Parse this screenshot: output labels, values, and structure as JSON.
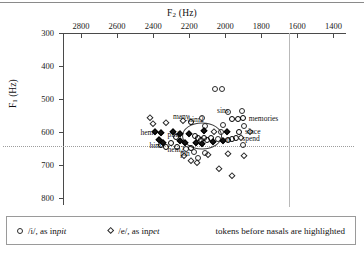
{
  "chart_data": {
    "type": "scatter",
    "title": "",
    "xlabel": "F2 (Hz)",
    "ylabel": "F1 (Hz)",
    "xlim": [
      2900,
      1330
    ],
    "ylim": [
      300,
      820
    ],
    "x_ticks": [
      2800,
      2600,
      2400,
      2200,
      2000,
      1800,
      1600,
      1400
    ],
    "y_ticks": [
      300,
      400,
      500,
      600,
      700,
      800
    ],
    "x_axis_reversed": true,
    "y_axis_reversed": true,
    "grid": false,
    "axis_position": "top-left",
    "reference_lines": [
      {
        "orientation": "horizontal",
        "value": 643,
        "style": "dotted"
      },
      {
        "orientation": "vertical",
        "value": 1648,
        "style": "solid-light"
      }
    ],
    "legend": {
      "position": "below-plot",
      "entries": [
        {
          "marker": "circle",
          "symbol": "/i/",
          "text": "/i/, as in ",
          "example": "pit"
        },
        {
          "marker": "diamond",
          "symbol": "/e/",
          "text": "/e/, as in ",
          "example": "pet"
        }
      ],
      "note": "tokens before nasals are highlighted"
    },
    "series": [
      {
        "name": "/i/, as in pit",
        "marker": "circle",
        "points": [
          {
            "x": 2055,
            "y": 468,
            "highlighted": false,
            "label": ""
          },
          {
            "x": 2020,
            "y": 470,
            "highlighted": false,
            "label": ""
          },
          {
            "x": 1985,
            "y": 538,
            "highlighted": false,
            "label": "sins"
          },
          {
            "x": 1905,
            "y": 536,
            "highlighted": false,
            "label": ""
          },
          {
            "x": 1960,
            "y": 560,
            "highlighted": true,
            "label": ""
          },
          {
            "x": 1930,
            "y": 560,
            "highlighted": true,
            "label": ""
          },
          {
            "x": 1900,
            "y": 558,
            "highlighted": true,
            "label": "memories"
          },
          {
            "x": 2010,
            "y": 578,
            "highlighted": false,
            "label": ""
          },
          {
            "x": 1895,
            "y": 582,
            "highlighted": false,
            "label": ""
          },
          {
            "x": 2025,
            "y": 598,
            "highlighted": false,
            "label": ""
          },
          {
            "x": 1925,
            "y": 598,
            "highlighted": true,
            "label": "since"
          },
          {
            "x": 2130,
            "y": 556,
            "highlighted": false,
            "label": ""
          },
          {
            "x": 2115,
            "y": 580,
            "highlighted": false,
            "label": ""
          },
          {
            "x": 2190,
            "y": 570,
            "highlighted": true,
            "label": "him2"
          },
          {
            "x": 2170,
            "y": 612,
            "highlighted": true,
            "label": ""
          },
          {
            "x": 2150,
            "y": 618,
            "highlighted": true,
            "label": ""
          },
          {
            "x": 2135,
            "y": 624,
            "highlighted": true,
            "label": ""
          },
          {
            "x": 2120,
            "y": 616,
            "highlighted": true,
            "label": ""
          },
          {
            "x": 2100,
            "y": 622,
            "highlighted": true,
            "label": ""
          },
          {
            "x": 2080,
            "y": 618,
            "highlighted": true,
            "label": ""
          },
          {
            "x": 2040,
            "y": 620,
            "highlighted": false,
            "label": "ten"
          },
          {
            "x": 1985,
            "y": 622,
            "highlighted": true,
            "label": ""
          },
          {
            "x": 1965,
            "y": 620,
            "highlighted": true,
            "label": ""
          },
          {
            "x": 1940,
            "y": 618,
            "highlighted": true,
            "label": "spend"
          },
          {
            "x": 2275,
            "y": 614,
            "highlighted": true,
            "label": "pin2"
          },
          {
            "x": 2300,
            "y": 632,
            "highlighted": true,
            "label": ""
          },
          {
            "x": 2330,
            "y": 644,
            "highlighted": true,
            "label": ""
          },
          {
            "x": 2355,
            "y": 638,
            "highlighted": true,
            "label": "him"
          },
          {
            "x": 2270,
            "y": 646,
            "highlighted": true,
            "label": "hem2"
          },
          {
            "x": 2215,
            "y": 652,
            "highlighted": false,
            "label": "pin"
          },
          {
            "x": 2190,
            "y": 648,
            "highlighted": true,
            "label": ""
          },
          {
            "x": 2175,
            "y": 660,
            "highlighted": false,
            "label": ""
          },
          {
            "x": 2110,
            "y": 662,
            "highlighted": false,
            "label": ""
          },
          {
            "x": 1900,
            "y": 638,
            "highlighted": false,
            "label": ""
          },
          {
            "x": 2150,
            "y": 678,
            "highlighted": false,
            "label": ""
          }
        ]
      },
      {
        "name": "/e/, as in pet",
        "marker": "diamond",
        "points": [
          {
            "x": 2420,
            "y": 556,
            "highlighted": false,
            "label": ""
          },
          {
            "x": 2330,
            "y": 572,
            "highlighted": false,
            "label": ""
          },
          {
            "x": 2235,
            "y": 566,
            "highlighted": false,
            "label": "many"
          },
          {
            "x": 2390,
            "y": 600,
            "highlighted": true,
            "label": "hem"
          },
          {
            "x": 2355,
            "y": 602,
            "highlighted": true,
            "label": ""
          },
          {
            "x": 2290,
            "y": 600,
            "highlighted": true,
            "label": ""
          },
          {
            "x": 2250,
            "y": 604,
            "highlighted": true,
            "label": ""
          },
          {
            "x": 2200,
            "y": 606,
            "highlighted": true,
            "label": ""
          },
          {
            "x": 2120,
            "y": 596,
            "highlighted": true,
            "label": ""
          },
          {
            "x": 2060,
            "y": 600,
            "highlighted": false,
            "label": ""
          },
          {
            "x": 1990,
            "y": 598,
            "highlighted": true,
            "label": ""
          },
          {
            "x": 1865,
            "y": 600,
            "highlighted": false,
            "label": ""
          },
          {
            "x": 2370,
            "y": 624,
            "highlighted": true,
            "label": ""
          },
          {
            "x": 2345,
            "y": 632,
            "highlighted": true,
            "label": ""
          },
          {
            "x": 2250,
            "y": 626,
            "highlighted": true,
            "label": ""
          },
          {
            "x": 2225,
            "y": 632,
            "highlighted": true,
            "label": ""
          },
          {
            "x": 2160,
            "y": 634,
            "highlighted": true,
            "label": ""
          },
          {
            "x": 2130,
            "y": 636,
            "highlighted": true,
            "label": ""
          },
          {
            "x": 2070,
            "y": 630,
            "highlighted": true,
            "label": ""
          },
          {
            "x": 2010,
            "y": 628,
            "highlighted": true,
            "label": ""
          },
          {
            "x": 2230,
            "y": 672,
            "highlighted": false,
            "label": ""
          },
          {
            "x": 2190,
            "y": 688,
            "highlighted": false,
            "label": ""
          },
          {
            "x": 2155,
            "y": 694,
            "highlighted": false,
            "label": ""
          },
          {
            "x": 2095,
            "y": 668,
            "highlighted": false,
            "label": ""
          },
          {
            "x": 1985,
            "y": 666,
            "highlighted": false,
            "label": ""
          },
          {
            "x": 2035,
            "y": 712,
            "highlighted": false,
            "label": ""
          },
          {
            "x": 1895,
            "y": 672,
            "highlighted": false,
            "label": ""
          },
          {
            "x": 1965,
            "y": 732,
            "highlighted": false,
            "label": ""
          },
          {
            "x": 1910,
            "y": 616,
            "highlighted": false,
            "label": ""
          },
          {
            "x": 2400,
            "y": 574,
            "highlighted": false,
            "label": ""
          }
        ]
      }
    ],
    "annotations": [
      {
        "text": "sins",
        "x": 2045,
        "y": 532
      },
      {
        "text": "memories",
        "x": 1870,
        "y": 556
      },
      {
        "text": "since",
        "x": 1890,
        "y": 596
      },
      {
        "text": "spend",
        "x": 1905,
        "y": 616
      },
      {
        "text": "ten",
        "x": 2020,
        "y": 620
      },
      {
        "text": "many",
        "x": 2290,
        "y": 550
      },
      {
        "text": "him2",
        "x": 2205,
        "y": 560
      },
      {
        "text": "hem",
        "x": 2470,
        "y": 600
      },
      {
        "text": "pin2",
        "x": 2320,
        "y": 604
      },
      {
        "text": "him",
        "x": 2420,
        "y": 640
      },
      {
        "text": "hem2",
        "x": 2320,
        "y": 650
      },
      {
        "text": "pin",
        "x": 2250,
        "y": 662
      }
    ],
    "cluster_highlight": {
      "x": 2130,
      "y": 610,
      "rx_hz": 105,
      "ry_hz": 38
    }
  },
  "axes": {
    "x_title": "F",
    "x_title_sub": "2",
    "x_title_unit": " (Hz)",
    "y_title": "F",
    "y_title_sub": "1",
    "y_title_unit": " (Hz)"
  },
  "legend": {
    "i_symbol": "/i/, as in ",
    "i_example": "pit",
    "e_symbol": "/e/, as in ",
    "e_example": "pet",
    "note": "tokens before nasals are highlighted"
  }
}
